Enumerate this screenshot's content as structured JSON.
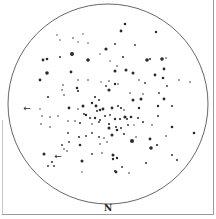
{
  "figure": {
    "type": "star-field-sketch",
    "orientation_label": "N",
    "field_circle": {
      "cx": 108,
      "cy": 104,
      "r": 100,
      "stroke": "#555555"
    },
    "star_color": "#2a2a2a",
    "markers": [
      {
        "name": "arrow-west",
        "x": 27,
        "y": 108,
        "glyph": "←"
      },
      {
        "name": "arrow-sw",
        "x": 58,
        "y": 156,
        "glyph": "←"
      }
    ],
    "stars": [
      [
        125,
        24,
        1.3
      ],
      [
        121,
        31,
        1.4
      ],
      [
        156,
        32,
        1.2
      ],
      [
        57,
        35,
        0.7
      ],
      [
        73,
        38,
        0.8
      ],
      [
        83,
        34,
        0.7
      ],
      [
        60,
        40,
        0.7
      ],
      [
        78,
        42,
        0.7
      ],
      [
        88,
        43,
        0.7
      ],
      [
        135,
        45,
        0.9
      ],
      [
        106,
        49,
        1.6
      ],
      [
        115,
        44,
        0.9
      ],
      [
        72,
        54,
        2.0
      ],
      [
        43,
        60,
        1.4
      ],
      [
        47,
        59,
        1.3
      ],
      [
        60,
        57,
        1.0
      ],
      [
        88,
        60,
        1.8
      ],
      [
        100,
        54,
        0.7
      ],
      [
        110,
        61,
        0.7
      ],
      [
        123,
        57,
        1.0
      ],
      [
        147,
        60,
        1.8
      ],
      [
        150,
        59,
        1.0
      ],
      [
        162,
        59,
        1.8
      ],
      [
        166,
        58,
        0.8
      ],
      [
        47,
        73,
        1.8
      ],
      [
        71,
        72,
        1.4
      ],
      [
        40,
        80,
        1.4
      ],
      [
        115,
        71,
        1.5
      ],
      [
        126,
        70,
        1.5
      ],
      [
        133,
        73,
        1.5
      ],
      [
        117,
        66,
        0.8
      ],
      [
        155,
        75,
        1.4
      ],
      [
        164,
        69,
        1.4
      ],
      [
        163,
        78,
        1.3
      ],
      [
        145,
        83,
        0.9
      ],
      [
        139,
        80,
        0.8
      ],
      [
        179,
        80,
        0.8
      ],
      [
        190,
        82,
        0.8
      ],
      [
        167,
        86,
        0.9
      ],
      [
        63,
        85,
        0.8
      ],
      [
        78,
        80,
        0.8
      ],
      [
        88,
        80,
        0.8
      ],
      [
        101,
        82,
        0.7
      ],
      [
        106,
        86,
        0.9
      ],
      [
        109,
        81,
        0.8
      ],
      [
        115,
        84,
        1.2
      ],
      [
        118,
        84,
        0.8
      ],
      [
        77,
        88,
        1.3
      ],
      [
        78,
        91,
        1.1
      ],
      [
        62,
        90,
        0.8
      ],
      [
        64,
        95,
        0.8
      ],
      [
        48,
        97,
        1.0
      ],
      [
        95,
        97,
        1.1
      ],
      [
        99,
        100,
        1.0
      ],
      [
        109,
        90,
        1.6
      ],
      [
        130,
        93,
        0.8
      ],
      [
        143,
        94,
        0.8
      ],
      [
        159,
        93,
        0.9
      ],
      [
        133,
        100,
        1.5
      ],
      [
        141,
        99,
        1.5
      ],
      [
        164,
        99,
        1.4
      ],
      [
        92,
        103,
        1.2
      ],
      [
        96,
        106,
        1.4
      ],
      [
        83,
        106,
        1.5
      ],
      [
        69,
        108,
        1.4
      ],
      [
        84,
        114,
        1.0
      ],
      [
        100,
        110,
        1.3
      ],
      [
        103,
        109,
        1.4
      ],
      [
        97,
        111,
        1.0
      ],
      [
        112,
        108,
        1.4
      ],
      [
        118,
        106,
        1.0
      ],
      [
        121,
        108,
        1.1
      ],
      [
        124,
        110,
        0.8
      ],
      [
        139,
        108,
        1.2
      ],
      [
        158,
        106,
        1.2
      ],
      [
        172,
        106,
        1.0
      ],
      [
        78,
        109,
        0.8
      ],
      [
        40,
        109,
        0.7
      ],
      [
        42,
        116,
        0.8
      ],
      [
        50,
        117,
        0.8
      ],
      [
        58,
        116,
        0.8
      ],
      [
        86,
        115,
        1.2
      ],
      [
        90,
        118,
        1.0
      ],
      [
        95,
        118,
        1.2
      ],
      [
        100,
        120,
        1.0
      ],
      [
        105,
        116,
        1.0
      ],
      [
        110,
        115,
        0.9
      ],
      [
        115,
        119,
        1.2
      ],
      [
        120,
        119,
        1.1
      ],
      [
        125,
        117,
        1.6
      ],
      [
        127,
        119,
        1.0
      ],
      [
        131,
        117,
        1.3
      ],
      [
        138,
        118,
        1.0
      ],
      [
        143,
        122,
        1.0
      ],
      [
        158,
        116,
        1.0
      ],
      [
        68,
        121,
        0.8
      ],
      [
        75,
        121,
        0.8
      ],
      [
        80,
        123,
        1.0
      ],
      [
        92,
        124,
        0.8
      ],
      [
        99,
        122,
        0.9
      ],
      [
        109,
        124,
        1.1
      ],
      [
        109,
        128,
        1.5
      ],
      [
        116,
        127,
        1.0
      ],
      [
        121,
        128,
        1.0
      ],
      [
        128,
        125,
        0.9
      ],
      [
        134,
        125,
        0.7
      ],
      [
        152,
        125,
        0.8
      ],
      [
        172,
        127,
        1.3
      ],
      [
        41,
        124,
        0.8
      ],
      [
        50,
        127,
        0.8
      ],
      [
        68,
        133,
        0.9
      ],
      [
        79,
        137,
        1.0
      ],
      [
        86,
        136,
        0.9
      ],
      [
        92,
        133,
        0.9
      ],
      [
        99,
        137,
        0.9
      ],
      [
        104,
        138,
        0.8
      ],
      [
        112,
        135,
        1.5
      ],
      [
        117,
        130,
        1.3
      ],
      [
        124,
        134,
        1.0
      ],
      [
        136,
        137,
        0.8
      ],
      [
        150,
        139,
        1.4
      ],
      [
        166,
        136,
        0.8
      ],
      [
        194,
        133,
        1.3
      ],
      [
        62,
        145,
        0.9
      ],
      [
        69,
        142,
        0.9
      ],
      [
        80,
        145,
        1.3
      ],
      [
        100,
        144,
        0.8
      ],
      [
        107,
        142,
        0.8
      ],
      [
        132,
        141,
        2.0
      ],
      [
        151,
        148,
        1.8
      ],
      [
        157,
        145,
        1.1
      ],
      [
        64,
        149,
        0.8
      ],
      [
        67,
        151,
        0.8
      ],
      [
        44,
        154,
        1.5
      ],
      [
        92,
        154,
        0.9
      ],
      [
        102,
        153,
        0.8
      ],
      [
        113,
        155,
        1.5
      ],
      [
        113,
        159,
        1.2
      ],
      [
        117,
        158,
        1.2
      ],
      [
        172,
        155,
        1.0
      ],
      [
        177,
        160,
        1.0
      ],
      [
        82,
        161,
        1.5
      ],
      [
        52,
        162,
        1.0
      ],
      [
        146,
        163,
        1.0
      ],
      [
        48,
        166,
        0.9
      ],
      [
        54,
        166,
        0.9
      ],
      [
        115,
        171,
        1.0
      ],
      [
        122,
        167,
        0.9
      ],
      [
        129,
        173,
        0.8
      ],
      [
        116,
        172,
        1.4
      ],
      [
        82,
        172,
        0.7
      ]
    ]
  }
}
